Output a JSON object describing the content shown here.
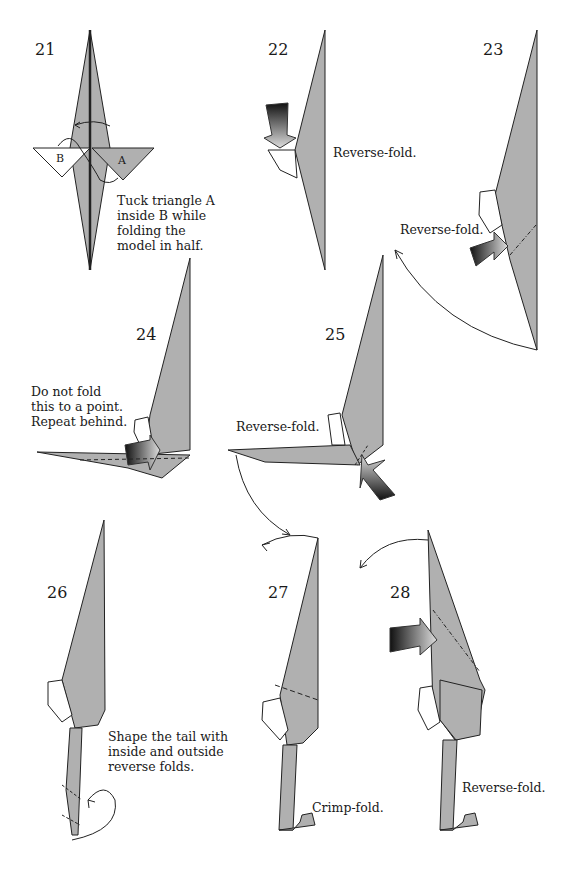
{
  "colors": {
    "paper": "#b0b0b0",
    "edge": "#222222",
    "background": "#ffffff"
  },
  "steps": [
    {
      "number": "21",
      "caption_lines": [
        "Tuck triangle A",
        "inside B while",
        "folding the",
        "model in half."
      ],
      "labels": [
        "B",
        "A"
      ]
    },
    {
      "number": "22",
      "caption_lines": [
        "Reverse-fold."
      ]
    },
    {
      "number": "23",
      "caption_lines": [
        "Reverse-fold."
      ]
    },
    {
      "number": "24",
      "caption_lines": [
        "Do not fold",
        "this to a point.",
        "Repeat behind."
      ]
    },
    {
      "number": "25",
      "caption_lines": [
        "Reverse-fold."
      ]
    },
    {
      "number": "26",
      "caption_lines": [
        "Shape the tail with",
        "inside and outside",
        "reverse folds."
      ]
    },
    {
      "number": "27",
      "caption_lines": [
        "Crimp-fold."
      ]
    },
    {
      "number": "28",
      "caption_lines": [
        "Reverse-fold."
      ]
    }
  ]
}
